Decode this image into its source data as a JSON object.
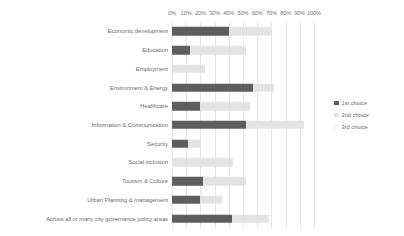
{
  "chart_data": {
    "type": "bar",
    "orientation": "horizontal",
    "stacked": true,
    "title": "",
    "subtitle": "",
    "xlabel": "",
    "ylabel": "",
    "xlim": [
      0,
      100
    ],
    "xtick_labels": [
      "0%",
      "10%",
      "20%",
      "30%",
      "40%",
      "50%",
      "60%",
      "70%",
      "80%",
      "90%",
      "100%"
    ],
    "xtick_values": [
      0,
      10,
      20,
      30,
      40,
      50,
      60,
      70,
      80,
      90,
      100
    ],
    "grid": true,
    "legend_position": "right",
    "categories": [
      "Economic development",
      "Education",
      "Employment",
      "Environment & Energy",
      "Healthcare",
      "Information & Communication",
      "Security",
      "Social inclusion",
      "Tourism & Culture",
      "Urban Planning & management",
      "Across all or many city governance policy areas"
    ],
    "series": [
      {
        "name": "1st choice",
        "color": "#5e5e5e",
        "values": [
          40,
          13,
          0,
          57,
          20,
          52,
          11,
          0,
          22,
          20,
          42
        ]
      },
      {
        "name": "2nd choice",
        "color": "#e3e3e3",
        "values": [
          30,
          39,
          23,
          15,
          35,
          41,
          9,
          43,
          30,
          15,
          26
        ]
      },
      {
        "name": "3rd choice",
        "color": "#f2f2f2",
        "values": [
          0,
          0,
          0,
          0,
          0,
          0,
          0,
          0,
          0,
          0,
          0
        ]
      }
    ],
    "totals": [
      70,
      52,
      23,
      72,
      55,
      93,
      20,
      43,
      52,
      35,
      68
    ]
  },
  "legend": {
    "items": [
      {
        "label": "1st choice",
        "color": "#5e5e5e"
      },
      {
        "label": "2nd choice",
        "color": "#e3e3e3"
      },
      {
        "label": "3rd choice",
        "color": "#f2f2f2"
      }
    ]
  },
  "colors": {
    "first_choice": "#5e5e5e",
    "second_choice": "#e3e3e3",
    "third_choice": "#f2f2f2",
    "gridline": "#e4e4e4",
    "text": "#6b6b6b",
    "background": "#ffffff"
  }
}
